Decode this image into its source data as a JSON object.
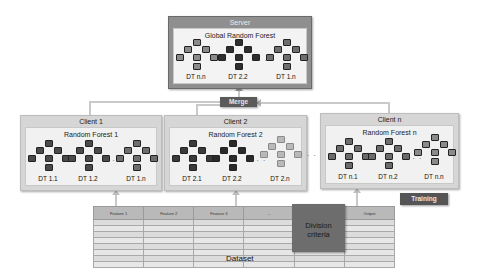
{
  "server": {
    "title": "Server",
    "forest_title": "Global Random Forest",
    "trees": [
      {
        "label": "DT n.n",
        "shade": "#8a8a8a"
      },
      {
        "label": "DT 2.2",
        "shade": "#2e2e2e"
      },
      {
        "label": "DT 1.n",
        "shade": "#6e6e6e"
      }
    ],
    "ellipsis": ". . ."
  },
  "merge": {
    "label": "Merge"
  },
  "clients": [
    {
      "title": "Client 1",
      "forest_title": "Random Forest 1",
      "trees": [
        {
          "label": "DT 1.1",
          "shade": "#4a4a4a"
        },
        {
          "label": "DT 1.2",
          "shade": "#4a4a4a"
        },
        {
          "label": "DT 1.n",
          "shade": "#6e6e6e"
        }
      ],
      "ellipsis": ". . ."
    },
    {
      "title": "Client 2",
      "forest_title": "Random Forest 2",
      "trees": [
        {
          "label": "DT 2.1",
          "shade": "#3a3a3a"
        },
        {
          "label": "DT 2.2",
          "shade": "#2a2a2a"
        },
        {
          "label": "DT 2.n",
          "shade": "#b9b9b9"
        }
      ],
      "ellipsis": ". . ."
    },
    {
      "title": "Client n",
      "forest_title": "Random Forest n",
      "trees": [
        {
          "label": "DT n.1",
          "shade": "#6a6a6a"
        },
        {
          "label": "DT n.2",
          "shade": "#6a6a6a"
        },
        {
          "label": "DT n.n",
          "shade": "#8a8a8a"
        }
      ],
      "ellipsis": ". . ."
    }
  ],
  "between_clients_ellipsis": ". . .",
  "training": {
    "label": "Training"
  },
  "dataset": {
    "label": "Dataset",
    "columns": [
      "Feature 1",
      "Feature 2",
      "Feature 3",
      "...",
      "Feature k",
      "Output"
    ],
    "row_count": 8,
    "division_label_line1": "Division",
    "division_label_line2": "criteria"
  }
}
